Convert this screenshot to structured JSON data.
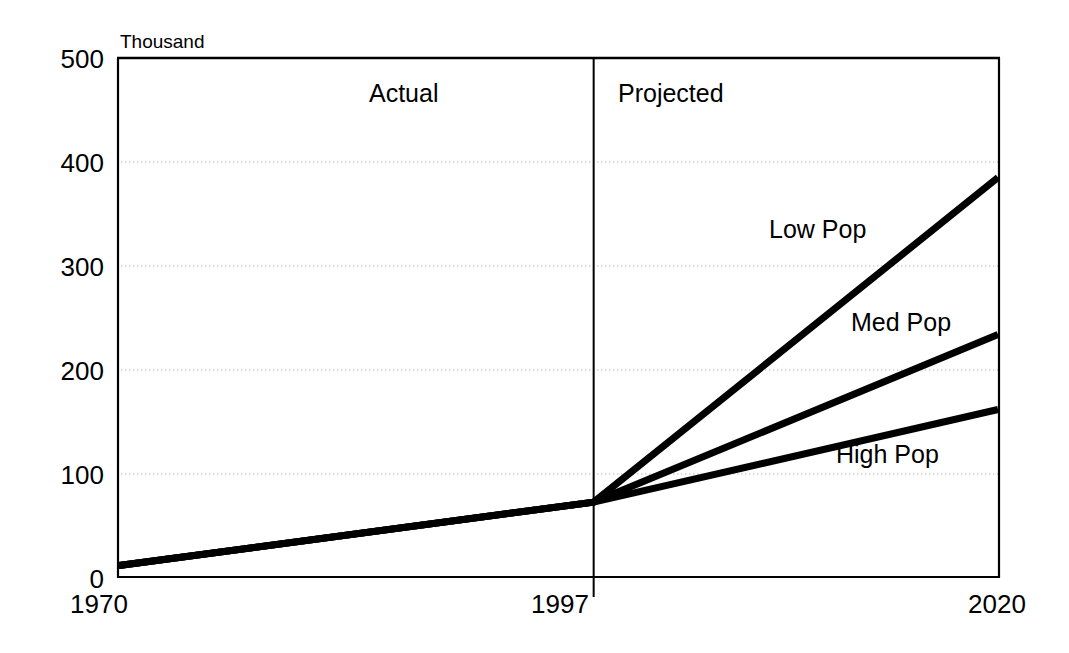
{
  "chart_data": {
    "type": "line",
    "title": "",
    "subtitle": "",
    "xlabel": "",
    "ylabel": "",
    "unit_label": "Thousand",
    "grid": true,
    "legend_position": "inline-right",
    "xlim": [
      1970,
      2020
    ],
    "ylim": [
      0,
      500
    ],
    "yticks": [
      0,
      100,
      200,
      300,
      400,
      500
    ],
    "ytick_labels": [
      "0",
      "100",
      "200",
      "300",
      "400",
      "500"
    ],
    "xticks": [
      1970,
      1997,
      2020
    ],
    "xtick_labels": [
      "1970",
      "1997",
      "2020"
    ],
    "divider_x": 1997,
    "annotations": [
      {
        "text": "Actual",
        "x": 1983,
        "y": 455
      },
      {
        "text": "Projected",
        "x": 2003,
        "y": 455
      }
    ],
    "series": [
      {
        "name": "Low Pop",
        "label": "Low Pop",
        "color": "#000000",
        "x": [
          1970,
          1997,
          2020
        ],
        "values": [
          12,
          73,
          385
        ],
        "label_x": 1992,
        "label_y": 322
      },
      {
        "name": "Med Pop",
        "label": "Med Pop",
        "color": "#000000",
        "x": [
          1970,
          1997,
          2020
        ],
        "values": [
          12,
          73,
          234
        ],
        "label_x": 2000,
        "label_y": 255
      },
      {
        "name": "High Pop",
        "label": "High Pop",
        "color": "#000000",
        "x": [
          1970,
          1997,
          2020
        ],
        "values": [
          12,
          73,
          162
        ],
        "label_x": 1999,
        "label_y": 120
      }
    ]
  },
  "axis": {
    "unit": "Thousand",
    "y_labels": [
      "500",
      "400",
      "300",
      "200",
      "100",
      "0"
    ],
    "x_labels": [
      "1970",
      "1997",
      "2020"
    ]
  },
  "periods": {
    "actual": "Actual",
    "projected": "Projected"
  },
  "series_labels": {
    "low": "Low Pop",
    "med": "Med Pop",
    "high": "High Pop"
  },
  "colors": {
    "line": "#000000",
    "frame": "#000000",
    "grid": "#b8b8b8",
    "background": "#ffffff"
  }
}
